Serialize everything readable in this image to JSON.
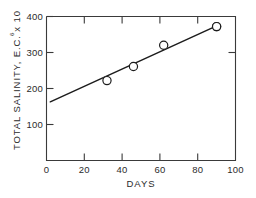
{
  "chart_data": {
    "type": "scatter",
    "title": "",
    "xlabel": "DAYS",
    "ylabel": "TOTAL SALINITY,  E.C. x 10",
    "ylabel_exponent": "6",
    "xlim": [
      0,
      100
    ],
    "ylim": [
      0,
      400
    ],
    "xticks": [
      0,
      20,
      40,
      60,
      80,
      100
    ],
    "yticks": [
      0,
      100,
      200,
      300,
      400
    ],
    "xtick_labels": [
      "0",
      "20",
      "40",
      "60",
      "80",
      "100"
    ],
    "ytick_labels": [
      "",
      "100",
      "200",
      "300",
      "400"
    ],
    "grid": false,
    "legend": false,
    "x": [
      2,
      32,
      46,
      62,
      90
    ],
    "y": [
      163,
      222,
      261,
      320,
      372
    ],
    "series": [
      {
        "name": "Total salinity measurements",
        "marker": "open-circle",
        "points": [
          {
            "x": 2,
            "y": 163
          },
          {
            "x": 32,
            "y": 222
          },
          {
            "x": 46,
            "y": 261
          },
          {
            "x": 62,
            "y": 320
          },
          {
            "x": 90,
            "y": 372
          }
        ]
      }
    ],
    "fit_line": {
      "type": "linear",
      "x_start": 2,
      "y_start": 163,
      "x_end": 90,
      "y_end": 374
    },
    "colors": {
      "axis": "#3a3a3a",
      "line": "#1c1c1c",
      "marker_fill": "#ffffff",
      "marker_edge": "#1c1c1c",
      "background": "#ffffff",
      "text": "#2b2b2b"
    }
  }
}
